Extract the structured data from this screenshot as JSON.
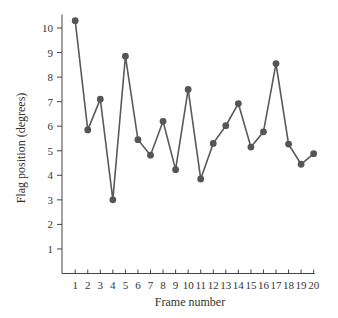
{
  "chart_data": {
    "type": "line",
    "title": "",
    "xlabel": "Frame number",
    "ylabel": "Flag position (degrees)",
    "x": [
      1,
      2,
      3,
      4,
      5,
      6,
      7,
      8,
      9,
      10,
      11,
      12,
      13,
      14,
      15,
      16,
      17,
      18,
      19,
      20
    ],
    "series": [
      {
        "name": "Flag position",
        "values": [
          10.3,
          5.85,
          7.1,
          3.0,
          8.85,
          5.45,
          4.82,
          6.2,
          4.23,
          7.5,
          3.85,
          5.3,
          6.02,
          6.92,
          5.15,
          5.77,
          8.55,
          5.27,
          4.45,
          4.88
        ]
      }
    ],
    "xticks": [
      "1",
      "2",
      "3",
      "4",
      "5",
      "6",
      "7",
      "8",
      "9",
      "10",
      "11",
      "12",
      "13",
      "14",
      "15",
      "16",
      "17",
      "18",
      "19",
      "20"
    ],
    "yticks": [
      "1",
      "2",
      "3",
      "4",
      "5",
      "6",
      "7",
      "8",
      "9",
      "10"
    ],
    "ylim": [
      0,
      10.5
    ],
    "xlim": [
      0,
      20
    ],
    "grid": false,
    "legend": "none",
    "colors": {
      "line": "#5a5a5a",
      "marker": "#555555",
      "axis": "#444444",
      "text": "#333333"
    }
  }
}
